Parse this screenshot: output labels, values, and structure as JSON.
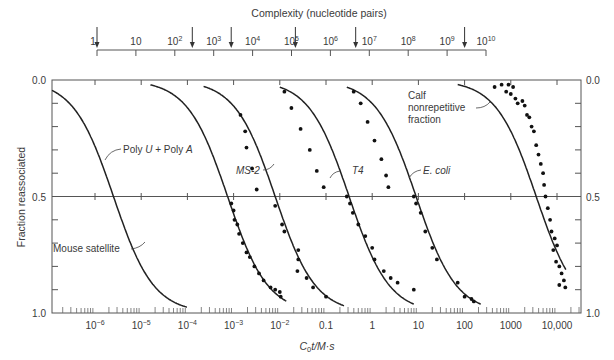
{
  "chart_data": {
    "type": "line",
    "title": "",
    "top_axis": {
      "label": "Complexity (nucleotide pairs)",
      "ticks": [
        {
          "exp": 0,
          "label": "1"
        },
        {
          "exp": 1,
          "label": "10"
        },
        {
          "exp": 2,
          "label": "10",
          "sup": "2"
        },
        {
          "exp": 3,
          "label": "10",
          "sup": "3"
        },
        {
          "exp": 4,
          "label": "10",
          "sup": "4"
        },
        {
          "exp": 5,
          "label": "10",
          "sup": "5"
        },
        {
          "exp": 6,
          "label": "10",
          "sup": "6"
        },
        {
          "exp": 7,
          "label": "10",
          "sup": "7"
        },
        {
          "exp": 8,
          "label": "10",
          "sup": "8"
        },
        {
          "exp": 9,
          "label": "10",
          "sup": "9"
        },
        {
          "exp": 10,
          "label": "10",
          "sup": "10"
        }
      ],
      "arrows_log10": [
        0,
        2.45,
        3.45,
        5.1,
        6.65,
        9.45
      ]
    },
    "xlabel": "C0t / M·s",
    "xlabel_parts": {
      "c": "C",
      "sub": "0",
      "rest": "t/M·s"
    },
    "xscale": "log",
    "xlim_log10": [
      -6.93,
      4.52
    ],
    "x_ticks": [
      {
        "exp": -6,
        "label": "10",
        "sup": "−6"
      },
      {
        "exp": -5,
        "label": "10",
        "sup": "−5"
      },
      {
        "exp": -4,
        "label": "10",
        "sup": "−4"
      },
      {
        "exp": -3,
        "label": "10",
        "sup": "−3"
      },
      {
        "exp": -2,
        "label": "10",
        "sup": "−2"
      },
      {
        "exp": -1,
        "label": "0.1"
      },
      {
        "exp": 0,
        "label": "1"
      },
      {
        "exp": 1,
        "label": "10"
      },
      {
        "exp": 2,
        "label": "100"
      },
      {
        "exp": 3,
        "label": "1000"
      },
      {
        "exp": 4,
        "label": "10,000"
      }
    ],
    "ylabel": "Fraction reassociated",
    "ylim": [
      0.0,
      1.0
    ],
    "y_inverted": true,
    "y_tick_labels": [
      {
        "value": 0.0,
        "label": "0.0"
      },
      {
        "value": 0.5,
        "label": "0.5"
      },
      {
        "value": 1.0,
        "label": "1.0"
      }
    ],
    "gridline_at": 0.5,
    "series": [
      {
        "name": "Poly U + Poly A",
        "label_parts": [
          "Poly ",
          "U",
          " + Poly ",
          "A"
        ],
        "c_half_log10": -5.6,
        "range_log10": [
          -6.93,
          -4.0
        ],
        "points": []
      },
      {
        "name": "Mouse satellite",
        "label_parts": [
          "Mouse satellite"
        ],
        "c_half_log10": -3.13,
        "range_log10": [
          -4.8,
          -1.85
        ],
        "points": [
          [
            -3.05,
            0.53
          ],
          [
            -3.0,
            0.56
          ],
          [
            -2.98,
            0.6
          ],
          [
            -2.92,
            0.62
          ],
          [
            -2.88,
            0.66
          ],
          [
            -2.8,
            0.7
          ],
          [
            -2.72,
            0.74
          ],
          [
            -2.65,
            0.76
          ],
          [
            -2.55,
            0.8
          ],
          [
            -2.45,
            0.83
          ],
          [
            -2.35,
            0.86
          ],
          [
            -2.2,
            0.89
          ],
          [
            -2.1,
            0.9
          ],
          [
            -2.0,
            0.91
          ],
          [
            -1.98,
            0.93
          ]
        ]
      },
      {
        "name": "MS-2",
        "label_parts": [
          "MS-2"
        ],
        "c_half_log10": -2.1,
        "range_log10": [
          -3.65,
          -0.6
        ],
        "points": [
          [
            -2.85,
            0.15
          ],
          [
            -2.75,
            0.22
          ],
          [
            -2.72,
            0.29
          ],
          [
            -2.6,
            0.38
          ],
          [
            -2.5,
            0.47
          ],
          [
            -2.1,
            0.54
          ],
          [
            -1.95,
            0.62
          ],
          [
            -1.9,
            0.65
          ],
          [
            -1.6,
            0.73
          ],
          [
            -1.6,
            0.77
          ],
          [
            -1.62,
            0.82
          ],
          [
            -1.42,
            0.85
          ],
          [
            -1.28,
            0.89
          ],
          [
            -1.0,
            0.93
          ]
        ]
      },
      {
        "name": "T4",
        "label_parts": [
          "T4"
        ],
        "c_half_log10": -0.5,
        "range_log10": [
          -2.0,
          0.9
        ],
        "points": [
          [
            -1.9,
            0.05
          ],
          [
            -1.75,
            0.12
          ],
          [
            -1.55,
            0.21
          ],
          [
            -1.35,
            0.3
          ],
          [
            -1.2,
            0.39
          ],
          [
            -1.05,
            0.46
          ],
          [
            -0.55,
            0.5
          ],
          [
            -0.48,
            0.53
          ],
          [
            -0.42,
            0.57
          ],
          [
            -0.3,
            0.62
          ],
          [
            -0.15,
            0.67
          ],
          [
            0.0,
            0.72
          ],
          [
            0.05,
            0.77
          ],
          [
            0.25,
            0.82
          ],
          [
            0.4,
            0.85
          ],
          [
            0.55,
            0.87
          ],
          [
            0.9,
            0.9
          ]
        ]
      },
      {
        "name": "E. coli",
        "label_parts": [
          "E. coli"
        ],
        "c_half_log10": 0.95,
        "range_log10": [
          -0.55,
          2.35
        ],
        "points": [
          [
            -0.4,
            0.05
          ],
          [
            -0.25,
            0.1
          ],
          [
            -0.1,
            0.18
          ],
          [
            0.05,
            0.26
          ],
          [
            0.2,
            0.34
          ],
          [
            0.3,
            0.41
          ],
          [
            0.35,
            0.46
          ],
          [
            0.9,
            0.5
          ],
          [
            0.95,
            0.53
          ],
          [
            1.05,
            0.57
          ],
          [
            1.15,
            0.65
          ],
          [
            1.3,
            0.72
          ],
          [
            1.4,
            0.77
          ],
          [
            1.85,
            0.87
          ],
          [
            2.0,
            0.93
          ],
          [
            2.15,
            0.94
          ],
          [
            2.2,
            0.95
          ]
        ]
      },
      {
        "name": "Calf nonrepetitive fraction",
        "label_parts": [
          "Calf",
          "nonrepetitive",
          "fraction"
        ],
        "c_half_log10": 3.55,
        "range_log10": [
          1.85,
          4.2
        ],
        "points": [
          [
            2.65,
            0.03
          ],
          [
            2.8,
            0.02
          ],
          [
            2.95,
            0.02
          ],
          [
            3.05,
            0.03
          ],
          [
            2.9,
            0.05
          ],
          [
            3.0,
            0.06
          ],
          [
            3.1,
            0.08
          ],
          [
            3.15,
            0.1
          ],
          [
            3.25,
            0.09
          ],
          [
            3.3,
            0.11
          ],
          [
            3.35,
            0.15
          ],
          [
            3.4,
            0.16
          ],
          [
            3.45,
            0.2
          ],
          [
            3.5,
            0.22
          ],
          [
            3.55,
            0.28
          ],
          [
            3.6,
            0.32
          ],
          [
            3.65,
            0.36
          ],
          [
            3.7,
            0.4
          ],
          [
            3.72,
            0.45
          ],
          [
            3.75,
            0.5
          ],
          [
            3.8,
            0.55
          ],
          [
            3.85,
            0.6
          ],
          [
            3.88,
            0.65
          ],
          [
            3.95,
            0.68
          ],
          [
            4.0,
            0.71
          ],
          [
            3.92,
            0.73
          ],
          [
            3.98,
            0.78
          ],
          [
            4.05,
            0.8
          ],
          [
            4.1,
            0.83
          ],
          [
            4.15,
            0.86
          ],
          [
            4.05,
            0.88
          ],
          [
            4.18,
            0.89
          ]
        ]
      }
    ],
    "legend": "none (curves labeled inline)"
  }
}
